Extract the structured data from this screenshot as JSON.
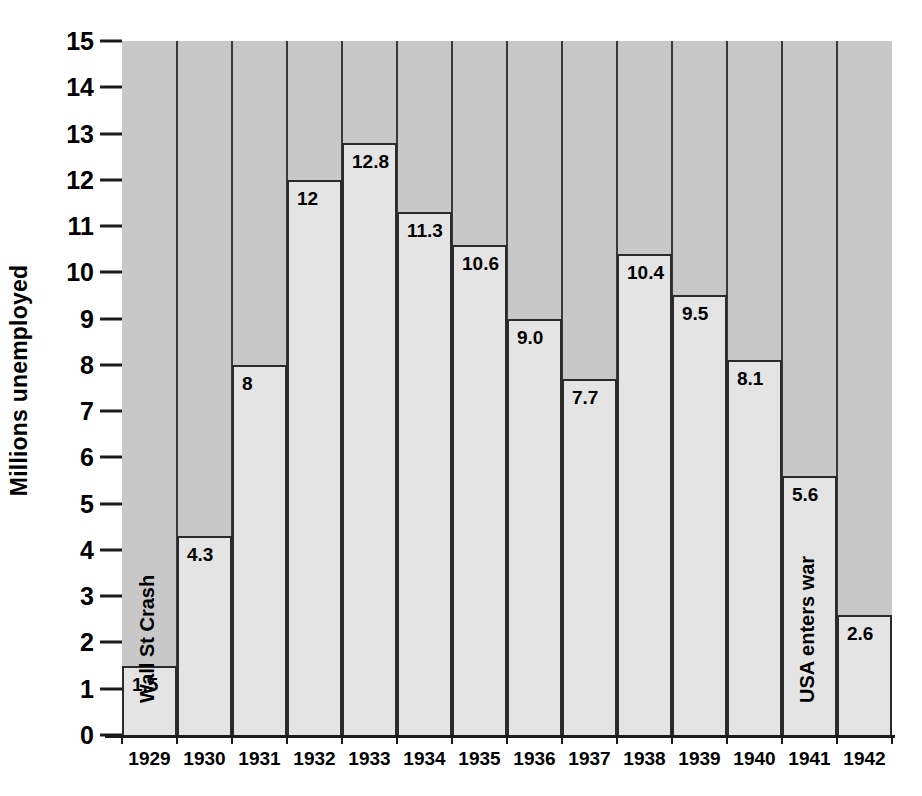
{
  "chart_data": {
    "type": "bar",
    "title": "",
    "xlabel": "",
    "ylabel": "Millions unemployed",
    "categories": [
      "1929",
      "1930",
      "1931",
      "1932",
      "1933",
      "1934",
      "1935",
      "1936",
      "1937",
      "1938",
      "1939",
      "1940",
      "1941",
      "1942"
    ],
    "values": [
      1.5,
      4.3,
      8,
      12,
      12.8,
      11.3,
      10.6,
      9.0,
      7.7,
      10.4,
      9.5,
      8.1,
      5.6,
      2.6
    ],
    "value_labels": [
      "1.5",
      "4.3",
      "8",
      "12",
      "12.8",
      "11.3",
      "10.6",
      "9.0",
      "7.7",
      "10.4",
      "9.5",
      "8.1",
      "5.6",
      "2.6"
    ],
    "ylim": [
      0,
      15
    ],
    "y_ticks": [
      0,
      1,
      2,
      3,
      4,
      5,
      6,
      7,
      8,
      9,
      10,
      11,
      12,
      13,
      14,
      15
    ],
    "y_tick_labels": [
      "0",
      "1",
      "2",
      "3",
      "4",
      "5",
      "6",
      "7",
      "8",
      "9",
      "10",
      "11",
      "12",
      "13",
      "14",
      "15"
    ],
    "grid": false,
    "legend": "none",
    "annotations": [
      {
        "text": "Wall St Crash",
        "category": "1929",
        "orientation": "vertical"
      },
      {
        "text": "USA enters war",
        "category": "1941",
        "orientation": "vertical"
      }
    ],
    "bands": [
      {
        "label": "Hoover president",
        "start_category": "1929",
        "end_category": "1932"
      },
      {
        "label": "Roosevelt president",
        "start_category": "1933",
        "end_category": "1942"
      }
    ],
    "colors": {
      "plot_background": "#c8c8c8",
      "bar_fill": "#e4e4e4",
      "bar_outline": "#2b2b2b",
      "band_background": "#e8e8e8",
      "text": "#000000",
      "page_background": "#ffffff"
    }
  }
}
